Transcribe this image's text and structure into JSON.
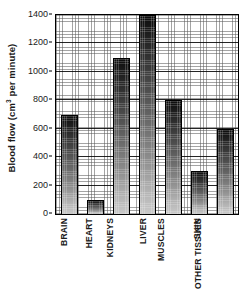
{
  "chart_data": {
    "type": "bar",
    "title": "",
    "xlabel": "",
    "ylabel": "Blood flow (cm³ per minute)",
    "ylabel_main": "Blood flow (cm",
    "ylabel_sup": "3",
    "ylabel_tail": " per minute)",
    "categories": [
      "BRAIN",
      "HEART",
      "KIDNEYS",
      "LIVER",
      "MUSCLES",
      "SKIN",
      "OTHER TISSUES"
    ],
    "values": [
      700,
      100,
      1100,
      1400,
      800,
      300,
      600
    ],
    "ylim": [
      0,
      1400
    ],
    "yticks": [
      0,
      200,
      400,
      600,
      800,
      1000,
      1200,
      1400
    ],
    "ytick_labels": [
      "0",
      "200",
      "400",
      "600",
      "800",
      "1000",
      "1200",
      "1400"
    ],
    "grid": true,
    "grid_style": "fine dotted crosshatch with solid lines at major ticks",
    "legend": null,
    "bar_fill": "vertical gradient dark-to-light with crosshatch texture",
    "colors": {
      "axis": "#000000",
      "text": "#1a1a1a",
      "bar_top": "#0d0d0d",
      "bar_bottom": "#c9c9c9",
      "background": "#ffffff"
    }
  }
}
